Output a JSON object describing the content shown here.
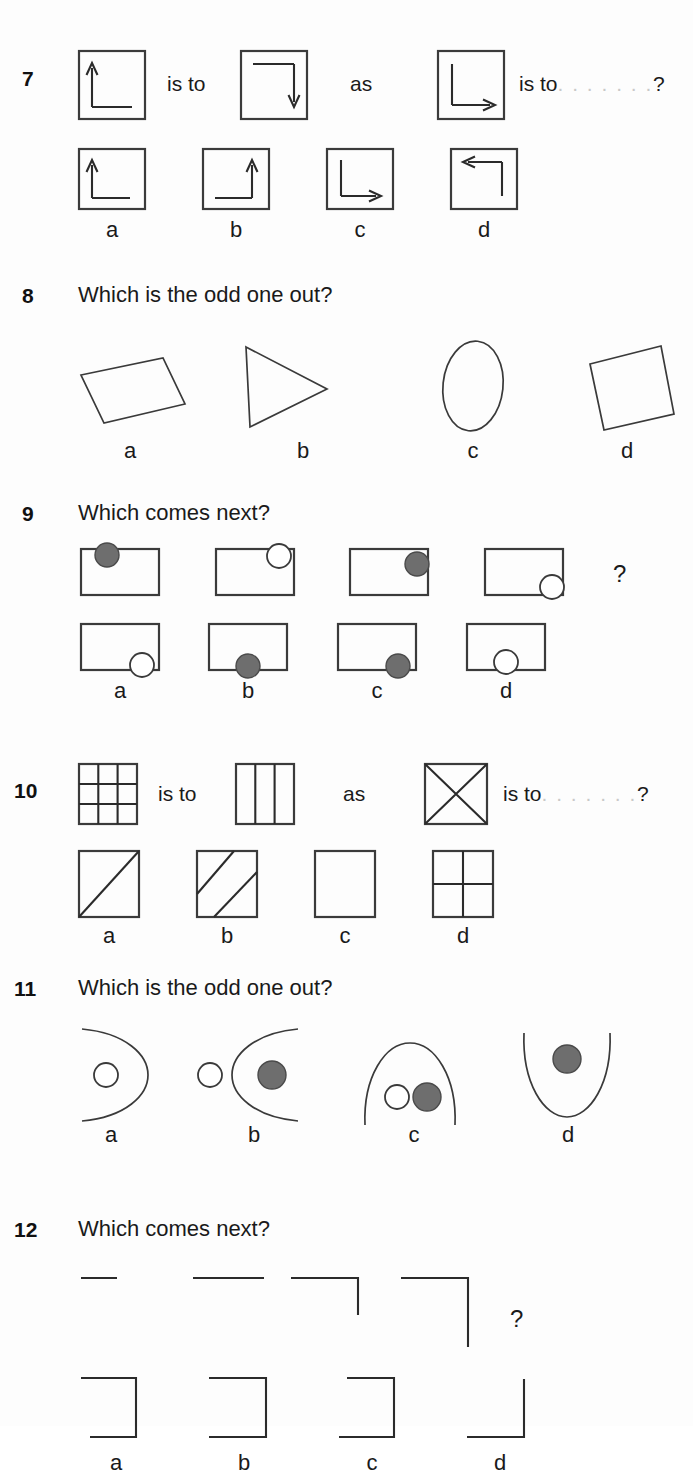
{
  "page": {
    "background": "#fdfdfd",
    "ink": "#2b2b2b",
    "grey_fill": "#6e6e6e",
    "dots_color": "#c9c9c9"
  },
  "questions": [
    {
      "number": "7",
      "prompt": "",
      "type": "analogy",
      "connector_1": "is to",
      "connector_2": "as",
      "connector_3": "is to",
      "dots": ". . . . . . .",
      "question_mark": "?",
      "stimulus": [
        {
          "name": "arrow-up-corner-left",
          "desc": "square with corner line from bottom-right to bottom-left then up with arrow at top"
        },
        {
          "name": "arrow-down-corner-right",
          "desc": "square with line from top-left to top-right then down with arrow at bottom"
        },
        {
          "name": "arrow-right-corner-bottom",
          "desc": "square with line from top-left down to bottom-left then right with arrow"
        }
      ],
      "options": [
        {
          "label": "a",
          "name": "arrow-up-corner-left"
        },
        {
          "label": "b",
          "name": "arrow-up-corner-right"
        },
        {
          "label": "c",
          "name": "arrow-right-corner-bottom"
        },
        {
          "label": "d",
          "name": "arrow-left-corner-top"
        }
      ]
    },
    {
      "number": "8",
      "prompt": "Which is the odd one out?",
      "type": "odd-one-out",
      "options": [
        {
          "label": "a",
          "name": "tilted-parallelogram"
        },
        {
          "label": "b",
          "name": "triangle-pointing-right"
        },
        {
          "label": "c",
          "name": "vertical-ellipse"
        },
        {
          "label": "d",
          "name": "tilted-square"
        }
      ]
    },
    {
      "number": "9",
      "prompt": "Which comes next?",
      "type": "sequence",
      "question_mark": "?",
      "stimulus": [
        {
          "name": "rect-circle-top-left",
          "fill": "grey",
          "position": "top-left"
        },
        {
          "name": "rect-circle-top-right",
          "fill": "white",
          "position": "top-right"
        },
        {
          "name": "rect-circle-right-upper",
          "fill": "grey",
          "position": "right-upper"
        },
        {
          "name": "rect-circle-bottom-right",
          "fill": "white",
          "position": "bottom-right"
        }
      ],
      "options": [
        {
          "label": "a",
          "name": "rect-circle-bottom-right",
          "fill": "white"
        },
        {
          "label": "b",
          "name": "rect-circle-bottom-centre",
          "fill": "grey"
        },
        {
          "label": "c",
          "name": "rect-circle-bottom-right-inner",
          "fill": "grey"
        },
        {
          "label": "d",
          "name": "rect-circle-bottom-centre-white",
          "fill": "white"
        }
      ]
    },
    {
      "number": "10",
      "prompt": "",
      "type": "analogy",
      "connector_1": "is to",
      "connector_2": "as",
      "connector_3": "is to",
      "dots": ". . . . . . .",
      "question_mark": "?",
      "stimulus": [
        {
          "name": "grid-three-by-three"
        },
        {
          "name": "three-vertical-columns"
        },
        {
          "name": "square-with-cross-diagonals"
        }
      ],
      "options": [
        {
          "label": "a",
          "name": "square-one-diagonal"
        },
        {
          "label": "b",
          "name": "square-two-parallel-diagonals"
        },
        {
          "label": "c",
          "name": "empty-square"
        },
        {
          "label": "d",
          "name": "square-quartered"
        }
      ]
    },
    {
      "number": "11",
      "prompt": "Which is the odd one out?",
      "type": "odd-one-out",
      "options": [
        {
          "label": "a",
          "name": "arc-opening-left-white-circle"
        },
        {
          "label": "b",
          "name": "arc-opening-right-white-outside-grey-inside"
        },
        {
          "label": "c",
          "name": "arc-opening-down-white-and-grey-circles"
        },
        {
          "label": "d",
          "name": "arc-opening-up-grey-circle"
        }
      ]
    },
    {
      "number": "12",
      "prompt": "Which comes next?",
      "type": "sequence",
      "question_mark": "?",
      "stimulus": [
        {
          "name": "short-horizontal-line"
        },
        {
          "name": "longer-horizontal-line"
        },
        {
          "name": "line-with-short-down-stroke"
        },
        {
          "name": "line-with-longer-down-stroke"
        }
      ],
      "options": [
        {
          "label": "a",
          "name": "bracket-opening-left-narrow"
        },
        {
          "label": "b",
          "name": "bracket-opening-left-wide"
        },
        {
          "label": "c",
          "name": "bracket-opening-left-tall"
        },
        {
          "label": "d",
          "name": "l-shape-bottom-right"
        }
      ]
    }
  ]
}
